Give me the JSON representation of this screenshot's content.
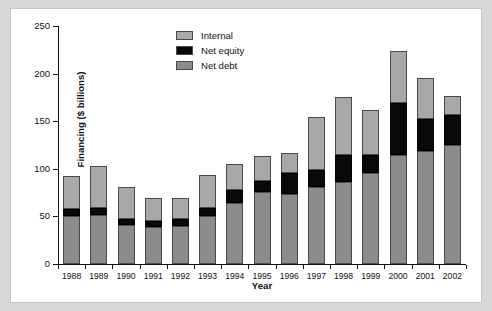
{
  "chart_data": {
    "type": "bar",
    "subtype": "stacked",
    "title": "",
    "xlabel": "Year",
    "ylabel": "Financing ($ billions)",
    "ylim": [
      0,
      250
    ],
    "yticks": [
      0,
      50,
      100,
      150,
      200,
      250
    ],
    "grid": false,
    "legend_position": "top-center",
    "categories": [
      "1988",
      "1989",
      "1990",
      "1991",
      "1992",
      "1993",
      "1994",
      "1995",
      "1996",
      "1997",
      "1998",
      "1999",
      "2000",
      "2001",
      "2002"
    ],
    "series": [
      {
        "name": "Net debt",
        "color": "#8c8c8c",
        "values": [
          50,
          52,
          41,
          39,
          40,
          50,
          64,
          76,
          74,
          81,
          86,
          96,
          114,
          119,
          125
        ]
      },
      {
        "name": "Net equity",
        "color": "#090909",
        "values": [
          8,
          7,
          6,
          6,
          7,
          9,
          14,
          11,
          22,
          18,
          29,
          19,
          55,
          33,
          32
        ]
      },
      {
        "name": "Internal",
        "color": "#a8a8a8",
        "values": [
          34,
          44,
          34,
          24,
          22,
          34,
          27,
          26,
          21,
          55,
          60,
          47,
          55,
          43,
          20
        ]
      }
    ],
    "totals": [
      92,
      103,
      81,
      69,
      69,
      93,
      105,
      113,
      117,
      154,
      175,
      162,
      224,
      195,
      177
    ],
    "stack_order_bottom_to_top": [
      "Net debt",
      "Net equity",
      "Internal"
    ]
  },
  "legend": {
    "items": [
      {
        "label": "Internal",
        "color": "#a8a8a8"
      },
      {
        "label": "Net equity",
        "color": "#090909"
      },
      {
        "label": "Net debt",
        "color": "#8c8c8c"
      }
    ]
  },
  "axes": {
    "y_title": "Financing ($ billions)",
    "x_title": "Year",
    "y_tick_labels": [
      "250",
      "200",
      "150",
      "100",
      "50",
      "0"
    ],
    "x_tick_labels": [
      "1988",
      "1989",
      "1990",
      "1991",
      "1992",
      "1993",
      "1994",
      "1995",
      "1996",
      "1997",
      "1998",
      "1999",
      "2000",
      "2001",
      "2002"
    ]
  }
}
